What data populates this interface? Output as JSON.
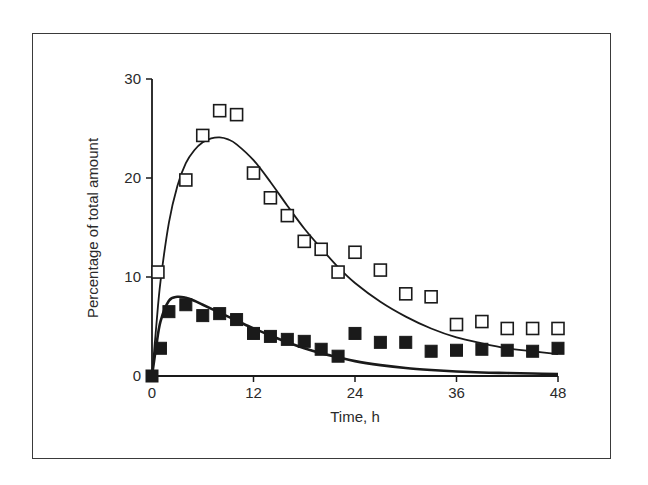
{
  "chart_data": {
    "type": "scatter",
    "title": "",
    "xlabel": "Time, h",
    "ylabel": "Percentage of total amount",
    "xlim": [
      0,
      48
    ],
    "ylim": [
      0,
      30
    ],
    "xticks": [
      0,
      12,
      24,
      36,
      48
    ],
    "yticks": [
      0,
      10,
      20,
      30
    ],
    "grid": false,
    "legend": null,
    "series": [
      {
        "name": "open squares (observed)",
        "marker": "open-square",
        "x": [
          0.7,
          4,
          6,
          8,
          10,
          12,
          14,
          16,
          18,
          20,
          22,
          24,
          27,
          30,
          33,
          36,
          39,
          42,
          45,
          48
        ],
        "y": [
          10.5,
          19.8,
          24.3,
          26.8,
          26.4,
          20.5,
          18.0,
          16.2,
          13.6,
          12.8,
          10.5,
          12.5,
          10.7,
          8.3,
          8.0,
          5.2,
          5.5,
          4.8,
          4.8,
          4.8
        ]
      },
      {
        "name": "filled squares (observed)",
        "marker": "filled-square",
        "x": [
          0,
          1,
          2,
          4,
          6,
          8,
          10,
          12,
          14,
          16,
          18,
          20,
          22,
          24,
          27,
          30,
          33,
          36,
          39,
          42,
          45,
          48
        ],
        "y": [
          0,
          2.8,
          6.5,
          7.2,
          6.1,
          6.3,
          5.7,
          4.3,
          4.0,
          3.7,
          3.5,
          2.7,
          2.0,
          4.3,
          3.4,
          3.4,
          2.5,
          2.6,
          2.7,
          2.6,
          2.5,
          2.8
        ]
      },
      {
        "name": "fitted curve (open squares)",
        "marker": "line",
        "x": [
          0,
          0.5,
          1,
          2,
          3,
          4,
          5,
          6,
          7,
          8,
          9,
          10,
          12,
          14,
          16,
          18,
          20,
          22,
          24,
          27,
          30,
          33,
          36,
          39,
          42,
          45,
          48
        ],
        "y": [
          0,
          5,
          9.5,
          15.5,
          19.2,
          21.5,
          22.8,
          23.6,
          24.0,
          24.1,
          23.9,
          23.4,
          21.8,
          19.6,
          17.2,
          14.9,
          12.9,
          11.0,
          9.4,
          7.5,
          6.0,
          4.8,
          3.9,
          3.3,
          2.8,
          2.5,
          2.2
        ]
      },
      {
        "name": "fitted curve (filled squares)",
        "marker": "line",
        "x": [
          0,
          0.5,
          1,
          2,
          3,
          4,
          5,
          6,
          8,
          10,
          12,
          14,
          16,
          18,
          20,
          22,
          24,
          27,
          30,
          33,
          36,
          39,
          42,
          45,
          48
        ],
        "y": [
          0,
          3.0,
          5.5,
          7.6,
          8.0,
          7.9,
          7.6,
          7.2,
          6.4,
          5.6,
          4.8,
          4.1,
          3.4,
          2.8,
          2.3,
          1.9,
          1.5,
          1.1,
          0.8,
          0.6,
          0.45,
          0.35,
          0.3,
          0.25,
          0.2
        ]
      }
    ]
  },
  "axes": {
    "x_label": "Time, h",
    "y_label": "Percentage of total amount",
    "x_tick_labels": [
      "0",
      "12",
      "24",
      "36",
      "48"
    ],
    "y_tick_labels": [
      "0",
      "10",
      "20",
      "30"
    ]
  },
  "colors": {
    "ink": "#1a1a1a",
    "frame": "#3a3a3a",
    "background": "#ffffff"
  }
}
